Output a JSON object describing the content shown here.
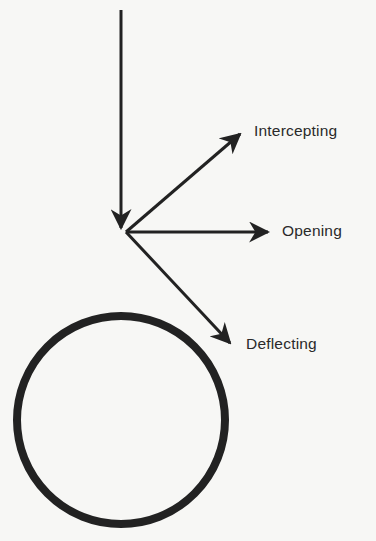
{
  "diagram": {
    "type": "force/path vector diagram",
    "colors": {
      "background": "#f7f7f5",
      "stroke": "#222222",
      "text": "#2a2a2a"
    },
    "incoming_arrow": {
      "from": [
        121,
        10
      ],
      "to": [
        121,
        230
      ]
    },
    "origin": [
      126,
      232
    ],
    "arrows": [
      {
        "id": "intercepting",
        "label": "Intercepting",
        "to": [
          242,
          132
        ]
      },
      {
        "id": "opening",
        "label": "Opening",
        "to": [
          270,
          232
        ]
      },
      {
        "id": "deflecting",
        "label": "Deflecting",
        "to": [
          232,
          345
        ]
      }
    ],
    "circle": {
      "cx": 121,
      "cy": 420,
      "r": 104,
      "stroke_width": 8
    }
  }
}
